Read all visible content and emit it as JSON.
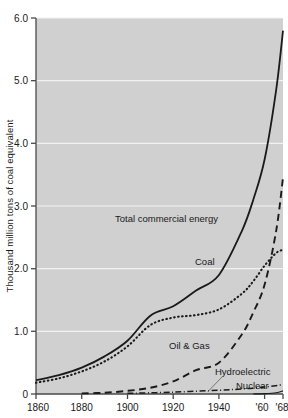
{
  "chart_data": {
    "type": "line",
    "title": "",
    "xlabel": "",
    "ylabel": "Thousand million tons of coal equivalent",
    "xlim": [
      1860,
      1968
    ],
    "ylim": [
      0,
      6.0
    ],
    "grid": true,
    "legend_position": "inline-annotations",
    "plot_background": "#d0d0d0",
    "line_color": "#1a1a1a",
    "gridline_color": "#f2f2f2",
    "xticks": [
      1860,
      1880,
      1900,
      1920,
      1940,
      1960,
      1968
    ],
    "xtick_labels": [
      "1860",
      "1880",
      "1900",
      "1920",
      "1940",
      "'60",
      "'68"
    ],
    "yticks": [
      0,
      1.0,
      2.0,
      3.0,
      4.0,
      5.0,
      6.0
    ],
    "ytick_labels": [
      "0",
      "1.0",
      "2.0",
      "3.0",
      "4.0",
      "5.0",
      "6.0"
    ],
    "series": [
      {
        "name": "Total commercial energy",
        "style": "solid",
        "label_x": 1905,
        "label_y": 2.95,
        "x": [
          1860,
          1870,
          1880,
          1890,
          1900,
          1910,
          1920,
          1930,
          1940,
          1950,
          1955,
          1960,
          1965,
          1968
        ],
        "values": [
          0.22,
          0.3,
          0.42,
          0.6,
          0.85,
          1.25,
          1.4,
          1.65,
          1.9,
          2.6,
          3.1,
          3.75,
          4.85,
          5.8
        ]
      },
      {
        "name": "Coal",
        "style": "dotted",
        "label_x": 1928,
        "label_y": 1.28,
        "x": [
          1860,
          1870,
          1880,
          1890,
          1900,
          1910,
          1920,
          1930,
          1940,
          1950,
          1955,
          1960,
          1965,
          1968
        ],
        "values": [
          0.18,
          0.25,
          0.36,
          0.52,
          0.76,
          1.1,
          1.22,
          1.26,
          1.35,
          1.6,
          1.8,
          2.05,
          2.25,
          2.3
        ]
      },
      {
        "name": "Oil & Gas",
        "style": "dashed",
        "label_x": 1916,
        "label_y": 0.62,
        "x": [
          1880,
          1890,
          1900,
          1910,
          1920,
          1930,
          1940,
          1950,
          1955,
          1960,
          1965,
          1968
        ],
        "values": [
          0.01,
          0.02,
          0.05,
          0.1,
          0.2,
          0.38,
          0.5,
          0.95,
          1.3,
          1.75,
          2.6,
          3.45
        ]
      },
      {
        "name": "Hydroelectric",
        "style": "dashdot",
        "label_x": 1943,
        "label_y": 0.36,
        "x": [
          1900,
          1920,
          1940,
          1950,
          1960,
          1968
        ],
        "values": [
          0.01,
          0.03,
          0.06,
          0.08,
          0.11,
          0.15
        ]
      },
      {
        "name": "Nuclear",
        "style": "solid-thin",
        "label_x": 1955,
        "label_y": 0.17,
        "x": [
          1955,
          1960,
          1965,
          1968
        ],
        "values": [
          0.0,
          0.005,
          0.02,
          0.05
        ]
      }
    ]
  },
  "axis": {
    "y_title": "Thousand million tons of coal equivalent"
  },
  "labels": {
    "total": "Total commercial energy",
    "coal": "Coal",
    "oilgas": "Oil & Gas",
    "hydro": "Hydroelectric",
    "nuclear": "Nuclear"
  },
  "yticks": {
    "t0": "0",
    "t1": "1.0",
    "t2": "2.0",
    "t3": "3.0",
    "t4": "4.0",
    "t5": "5.0",
    "t6": "6.0"
  },
  "xticks": {
    "t1860": "1860",
    "t1880": "1880",
    "t1900": "1900",
    "t1920": "1920",
    "t1940": "1940",
    "t1960": "'60",
    "t1968": "'68"
  }
}
